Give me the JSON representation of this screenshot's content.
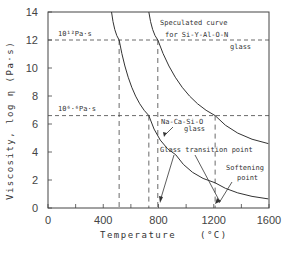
{
  "chart_data": {
    "type": "line",
    "title": "",
    "xlabel": "Temperature",
    "xunit": "(°C)",
    "ylabel": "Viscosity, log η (Pa·s)",
    "xlim": [
      0,
      1600
    ],
    "ylim": [
      0,
      14
    ],
    "xticks": [
      "0",
      "400",
      "800",
      "1200",
      "1600"
    ],
    "yticks": [
      "0",
      "2",
      "4",
      "6",
      "8",
      "10",
      "12",
      "14"
    ],
    "grid": false,
    "series": [
      {
        "name": "Na-Ca-Si-O glass",
        "x": [
          460,
          515,
          730,
          925,
          1210,
          1595
        ],
        "y": [
          14,
          12,
          6.6,
          3.8,
          1.8,
          0.65
        ]
      },
      {
        "name": "Speculated curve for Si-Y-Al-O-N glass",
        "x": [
          730,
          795,
          1210,
          1595
        ],
        "y": [
          14,
          12,
          6.6,
          4.6
        ]
      }
    ],
    "reference_lines": [
      {
        "label": "10^12 Pa·s",
        "y": 12
      },
      {
        "label": "10^6.6 Pa·s",
        "y": 6.6
      },
      {
        "x": 515
      },
      {
        "x": 730
      },
      {
        "x": 795
      },
      {
        "x": 1210
      }
    ],
    "annotations": [
      "Speculated curve",
      "for Si-Y-Al-O-N",
      "glass",
      "Na-Ca-Si-O",
      "glass",
      "Glass transition point",
      "Softening",
      "point"
    ]
  },
  "labels": {
    "ref12": "10¹²Pa·s",
    "ref66": "10⁶·⁶Pa·s",
    "spec1": "Speculated curve",
    "spec2": "for Si-Y-Al-O-N",
    "spec3": "glass",
    "na1": "Na-Ca-Si-O",
    "na2": "glass",
    "gt": "Glass transition point",
    "soft1": "Softening",
    "soft2": "point",
    "xlabel": "Temperature",
    "xunit": "(°C)",
    "ylabel": "Viscosity, log η (Pa·s)"
  }
}
